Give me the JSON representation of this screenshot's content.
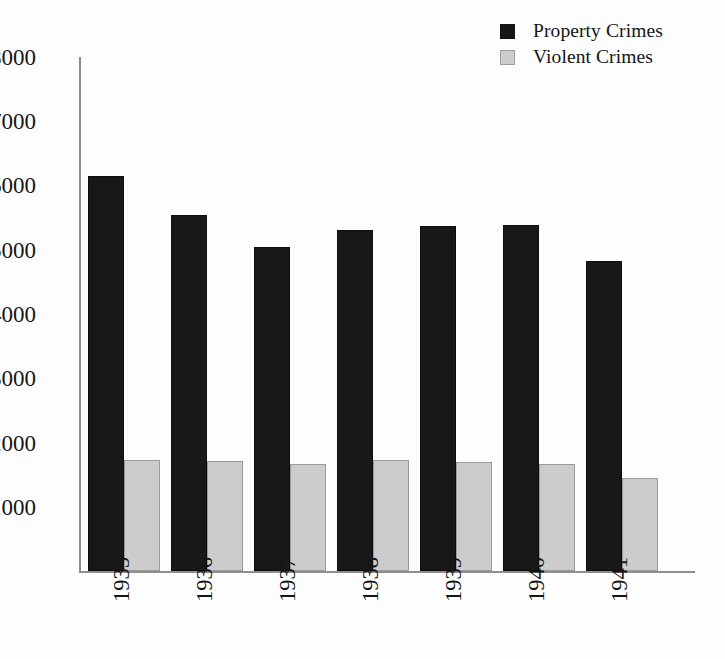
{
  "legend": {
    "position": "top-right",
    "entries": [
      {
        "label": "Property Crimes",
        "swatch": "dark",
        "color": "#181818"
      },
      {
        "label": "Violent Crimes",
        "swatch": "light",
        "color": "#cccccc"
      }
    ]
  },
  "axes": {
    "y_ticks": [
      "8000",
      "7000",
      "6000",
      "5000",
      "4000",
      "3000",
      "2000",
      "1000"
    ],
    "y_min": 0,
    "y_max": 8000,
    "x_ticks": [
      "1935",
      "1936",
      "1937",
      "1938",
      "1939",
      "1940",
      "1941"
    ]
  },
  "chart_data": {
    "type": "bar",
    "title": "",
    "xlabel": "",
    "ylabel": "",
    "ylim": [
      0,
      8000
    ],
    "grid": false,
    "legend_position": "top-right",
    "categories": [
      "1935",
      "1936",
      "1937",
      "1938",
      "1939",
      "1940",
      "1941"
    ],
    "series": [
      {
        "name": "Property Crimes",
        "color": "#181818",
        "values": [
          6150,
          5540,
          5050,
          5300,
          5365,
          5380,
          4825
        ]
      },
      {
        "name": "Violent Crimes",
        "color": "#cccccc",
        "values": [
          1730,
          1720,
          1670,
          1730,
          1700,
          1670,
          1440
        ]
      }
    ]
  }
}
